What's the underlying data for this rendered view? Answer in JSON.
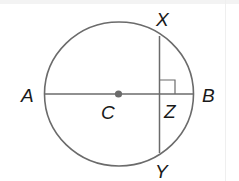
{
  "diagram": {
    "type": "circle-geometry",
    "colors": {
      "stroke": "#6b6b6b",
      "center_dot": "#6b6b6b",
      "label": "#1a1a1a"
    },
    "labels": {
      "A": "A",
      "B": "B",
      "C": "C",
      "X": "X",
      "Y": "Y",
      "Z": "Z"
    },
    "elements": {
      "circle": {
        "center": "C"
      },
      "diameter": {
        "from": "A",
        "to": "B"
      },
      "chord": {
        "from": "X",
        "to": "Y"
      },
      "intersection": "Z",
      "right_angle_marker": "at Z between ZX and ZB"
    }
  }
}
